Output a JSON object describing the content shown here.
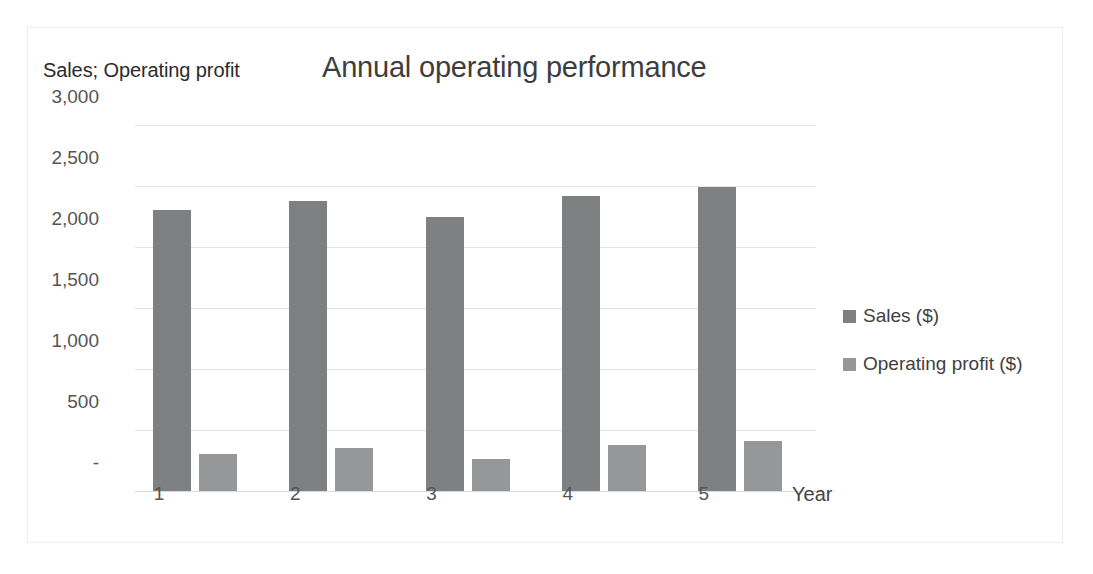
{
  "chart_data": {
    "type": "bar",
    "title": "Annual operating performance",
    "ylabel": "Sales; Operating profit",
    "xlabel": "Year",
    "categories": [
      "1",
      "2",
      "3",
      "4",
      "5"
    ],
    "ylim": [
      0,
      3000
    ],
    "ytick_labels": [
      "3,000",
      "2,500",
      "2,000",
      "1,500",
      "1,000",
      "500",
      "-"
    ],
    "ytick_values": [
      3000,
      2500,
      2000,
      1500,
      1000,
      500,
      0
    ],
    "grid": true,
    "legend_position": "right",
    "series": [
      {
        "name": "Sales ($)",
        "color": "#7f8081",
        "values": [
          2300,
          2380,
          2250,
          2420,
          2490
        ]
      },
      {
        "name": "Operating profit ($)",
        "color": "#969798",
        "values": [
          300,
          350,
          260,
          375,
          410
        ]
      }
    ]
  }
}
